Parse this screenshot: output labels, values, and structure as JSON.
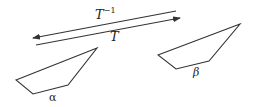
{
  "diagram": {
    "arrows": [
      {
        "name": "inverse-transform",
        "label_base": "T",
        "label_exponent": "−1",
        "direction": "right-to-left",
        "from": [
          176,
          11
        ],
        "to": [
          33,
          38
        ]
      },
      {
        "name": "transform",
        "label": "T",
        "direction": "left-to-right",
        "from": [
          36,
          45
        ],
        "to": [
          180,
          18
        ]
      }
    ],
    "shapes": [
      {
        "name": "alpha",
        "label": "α",
        "points": [
          [
            16,
            80
          ],
          [
            97,
            48
          ],
          [
            68,
            85
          ],
          [
            33,
            94
          ]
        ]
      },
      {
        "name": "beta",
        "label": "β",
        "points": [
          [
            158,
            55
          ],
          [
            240,
            24
          ],
          [
            209,
            61
          ],
          [
            176,
            69
          ]
        ]
      }
    ],
    "stroke_color": "#333333"
  }
}
